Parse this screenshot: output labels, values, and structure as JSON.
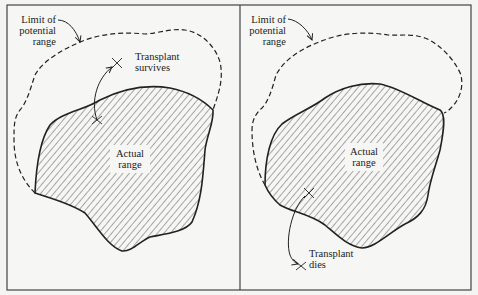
{
  "figure": {
    "panels": [
      {
        "id": "left",
        "outcome": "survives",
        "labels": {
          "potential_range": [
            "Limit of",
            "potential",
            "range"
          ],
          "actual_range": [
            "Actual",
            "range"
          ],
          "transplant": [
            "Transplant",
            "survives"
          ]
        }
      },
      {
        "id": "right",
        "outcome": "dies",
        "labels": {
          "potential_range": [
            "Limit of",
            "potential",
            "range"
          ],
          "actual_range": [
            "Actual",
            "range"
          ],
          "transplant": [
            "Transplant",
            "dies"
          ]
        }
      }
    ],
    "colors": {
      "background": "#f4f4f2",
      "ink": "#222222",
      "hatch": "#555555",
      "frame": "#444444"
    }
  }
}
